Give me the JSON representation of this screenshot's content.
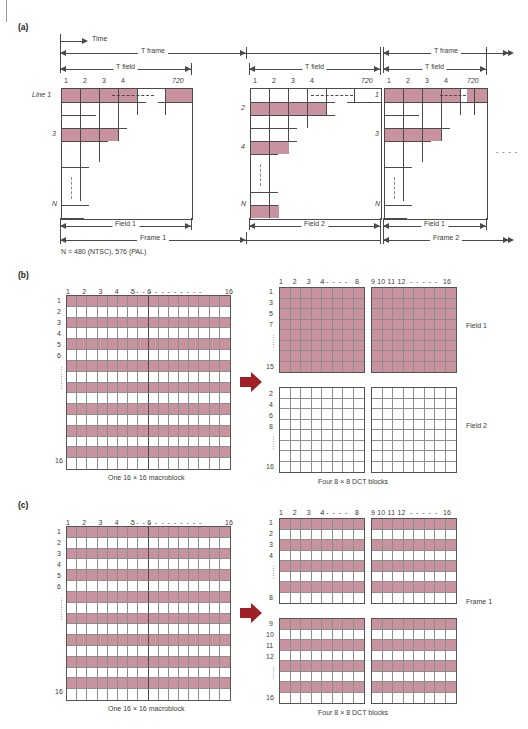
{
  "figure": {
    "panels": [
      {
        "key": "a",
        "label": "(a)"
      },
      {
        "key": "b",
        "label": "(b)"
      },
      {
        "key": "c",
        "label": "(c)"
      }
    ]
  },
  "panel_a": {
    "time_label": "Time",
    "line_label": "Line 1",
    "note": "N = 480 (NTSC), 576 (PAL)",
    "col_ticks": [
      "1",
      "2",
      "3",
      "4",
      "720"
    ],
    "diagrams": [
      {
        "name": "field-1-frame-1",
        "t_frame": "T frame",
        "t_field": "T field",
        "row_labels": [
          "Line 1",
          "3",
          "N"
        ],
        "bottom_field": "Field 1",
        "bottom_frame": "Frame 1"
      },
      {
        "name": "field-2-frame-1",
        "t_frame": "T frame",
        "t_field": "T field",
        "row_labels": [
          "2",
          "4",
          "N"
        ],
        "bottom_field": "Field 2",
        "bottom_frame": "Frame 1"
      },
      {
        "name": "field-1-frame-2",
        "t_frame": "T frame",
        "t_field": "T field",
        "row_labels": [
          "1",
          "3",
          "N"
        ],
        "bottom_field": "Field 1",
        "bottom_frame": "Frame 2"
      }
    ]
  },
  "panel_b": {
    "macroblock": {
      "caption": "One 16 × 16 macroblock",
      "col_labels": [
        "1",
        "2",
        "3",
        "4",
        "5",
        "6",
        "16"
      ],
      "row_labels": [
        "1",
        "2",
        "3",
        "4",
        "5",
        "6",
        "16"
      ],
      "pink_rows": [
        1,
        3,
        5,
        7,
        9,
        11,
        13,
        15
      ]
    },
    "blocks_caption": "Four 8 × 8 DCT blocks",
    "col_header_left": [
      "1",
      "2",
      "3",
      "4",
      "8"
    ],
    "col_header_right": [
      "9",
      "10",
      "11",
      "12",
      "16"
    ],
    "top_row_labels": [
      "1",
      "3",
      "5",
      "7",
      "15"
    ],
    "bottom_row_labels": [
      "2",
      "4",
      "6",
      "8",
      "16"
    ],
    "side_label_top": "Field 1",
    "side_label_bottom": "Field 2",
    "top_blocks_all_pink": true,
    "bottom_blocks_all_pink": false
  },
  "panel_c": {
    "macroblock": {
      "caption": "One 16 × 16 macroblock",
      "col_labels": [
        "1",
        "2",
        "3",
        "4",
        "5",
        "6",
        "16"
      ],
      "row_labels": [
        "1",
        "2",
        "3",
        "4",
        "5",
        "6",
        "16"
      ],
      "pink_rows": [
        1,
        3,
        5,
        7,
        9,
        11,
        13,
        15
      ]
    },
    "blocks_caption": "Four 8 × 8 DCT blocks",
    "col_header_left": [
      "1",
      "2",
      "3",
      "4",
      "8"
    ],
    "col_header_right": [
      "9",
      "10",
      "11",
      "12",
      "16"
    ],
    "top_row_labels": [
      "1",
      "2",
      "3",
      "4",
      "8"
    ],
    "bottom_row_labels": [
      "9",
      "10",
      "11",
      "12",
      "16"
    ],
    "side_label": "Frame 1",
    "block_pink_rows": [
      1,
      3,
      5,
      7
    ]
  },
  "colors": {
    "pink": "#c8929e",
    "line": "#4a4a4a",
    "grid": "#8e8e8e",
    "red_arrow": "#a02028",
    "text": "#3b3b3b"
  },
  "icons": {
    "transform_arrow": "right-arrow-icon",
    "dim_arrow": "double-headed-arrow-icon",
    "time_arrow": "right-arrow-icon"
  }
}
